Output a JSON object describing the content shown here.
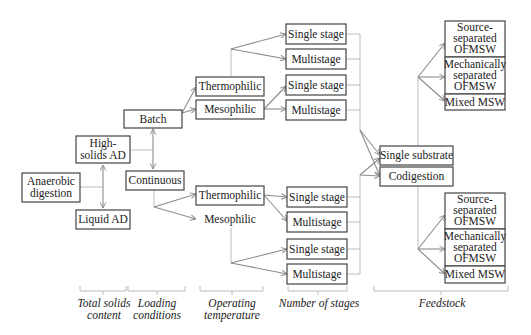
{
  "diagram": {
    "root": {
      "label_lines": [
        "Anaerobic",
        "digestion"
      ]
    },
    "total_solids": [
      {
        "label_lines": [
          "High-",
          "solids AD"
        ]
      },
      {
        "label_lines": [
          "Liquid AD"
        ]
      }
    ],
    "loading": [
      {
        "label_lines": [
          "Batch"
        ]
      },
      {
        "label_lines": [
          "Continuous"
        ]
      }
    ],
    "temperature": {
      "batch": [
        {
          "label": "Thermophilic"
        },
        {
          "label": "Mesophilic"
        }
      ],
      "continuous": [
        {
          "label": "Thermophilic"
        },
        {
          "label": "Mesophilic"
        }
      ]
    },
    "stages": [
      {
        "label": "Single stage"
      },
      {
        "label": "Multistage"
      },
      {
        "label": "Single stage"
      },
      {
        "label": "Multistage"
      },
      {
        "label": "Single stage"
      },
      {
        "label": "Multistage"
      },
      {
        "label": "Single stage"
      },
      {
        "label": "Multistage"
      }
    ],
    "substrate": [
      {
        "label": "Single substrate"
      },
      {
        "label": "Codigestion"
      }
    ],
    "feedstock_top": [
      {
        "label_lines": [
          "Source-",
          "separated",
          "OFMSW"
        ]
      },
      {
        "label_lines": [
          "Mechanically",
          "separated",
          "OFMSW"
        ]
      },
      {
        "label_lines": [
          "Mixed MSW"
        ]
      }
    ],
    "feedstock_bottom": [
      {
        "label_lines": [
          "Source-",
          "separated",
          "OFMSW"
        ]
      },
      {
        "label_lines": [
          "Mechanically",
          "separated",
          "OFMSW"
        ]
      },
      {
        "label_lines": [
          "Mixed MSW"
        ]
      }
    ],
    "categories": [
      {
        "label_lines": [
          "Total solids",
          "content"
        ]
      },
      {
        "label_lines": [
          "Loading",
          "conditions"
        ]
      },
      {
        "label_lines": [
          "Operating",
          "temperature"
        ]
      },
      {
        "label_lines": [
          "Number of stages"
        ]
      },
      {
        "label_lines": [
          "Feedstock"
        ]
      }
    ]
  }
}
